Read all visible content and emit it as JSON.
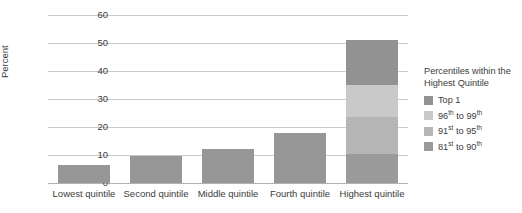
{
  "chart_data": {
    "type": "bar",
    "stacked": true,
    "title": "",
    "xlabel": "",
    "ylabel": "Percent",
    "ylim": [
      0,
      60
    ],
    "yticks": [
      0,
      10,
      20,
      30,
      40,
      50,
      60
    ],
    "ytick_labels": [
      "0",
      "10",
      "20",
      "30",
      "40",
      "50",
      "60"
    ],
    "grid": true,
    "legend_position": "right",
    "categories": [
      "Lowest quintile",
      "Second quintile",
      "Middle quintile",
      "Fourth quintile",
      "Highest quintile"
    ],
    "series": [
      {
        "name": "81st to 90th",
        "values": [
          6.5,
          9.5,
          12.0,
          18.0,
          10.5
        ]
      },
      {
        "name": "91st to 95th",
        "values": [
          0,
          0,
          0,
          0,
          13.0
        ]
      },
      {
        "name": "96th to 99th",
        "values": [
          0,
          0,
          0,
          0,
          11.5
        ]
      },
      {
        "name": "Top 1",
        "values": [
          0,
          0,
          0,
          0,
          16.0
        ]
      }
    ],
    "totals": [
      6.5,
      9.5,
      12.0,
      18.0,
      51.0
    ],
    "colors": {
      "top1": "#929292",
      "p96_99": "#c9c9c9",
      "p91_95": "#b5b5b5",
      "p81_90": "#9a9a9a",
      "single_bar": "#969696",
      "grid": "#c9c9c9",
      "axis": "#b3b3b3",
      "text": "#3b3b3b"
    }
  },
  "legend": {
    "title_line1": "Percentiles within the",
    "title_line2": "Highest Quintile",
    "items": [
      {
        "label_main": "Top 1",
        "sup1": "",
        "mid": "",
        "label_end": "",
        "sup2": "",
        "color": "#929292"
      },
      {
        "label_main": "96",
        "sup1": "th",
        "mid": " to ",
        "label_end": "99",
        "sup2": "th",
        "color": "#c9c9c9"
      },
      {
        "label_main": "91",
        "sup1": "st",
        "mid": " to ",
        "label_end": "95",
        "sup2": "th",
        "color": "#b5b5b5"
      },
      {
        "label_main": "81",
        "sup1": "st",
        "mid": " to ",
        "label_end": "90",
        "sup2": "th",
        "color": "#9a9a9a"
      }
    ]
  }
}
